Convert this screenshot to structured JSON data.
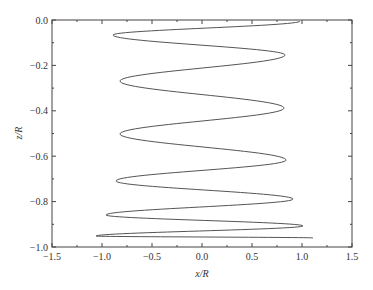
{
  "chart_data": {
    "type": "line",
    "title": "",
    "xlabel": "x/R",
    "ylabel": "z/R",
    "xlim": [
      -1.5,
      1.5
    ],
    "ylim": [
      -1.0,
      0.0
    ],
    "grid": false,
    "legend": null,
    "x_ticks": [
      "-1.5",
      "-1.0",
      "-0.5",
      "0.0",
      "0.5",
      "1.0",
      "1.5"
    ],
    "y_ticks": [
      "0.0",
      "-0.2",
      "-0.4",
      "-0.6",
      "-0.8",
      "-1.0"
    ],
    "series": [
      {
        "name": "trajectory",
        "color": "#555555",
        "points": [
          [
            0.98,
            -0.005
          ],
          [
            -0.89,
            -0.066
          ],
          [
            0.83,
            -0.154
          ],
          [
            -0.82,
            -0.269
          ],
          [
            0.82,
            -0.388
          ],
          [
            -0.82,
            -0.502
          ],
          [
            0.84,
            -0.617
          ],
          [
            -0.86,
            -0.709
          ],
          [
            0.91,
            -0.789
          ],
          [
            -0.96,
            -0.859
          ],
          [
            1.01,
            -0.907
          ],
          [
            -1.06,
            -0.952
          ],
          [
            1.11,
            -0.96
          ]
        ]
      }
    ]
  }
}
